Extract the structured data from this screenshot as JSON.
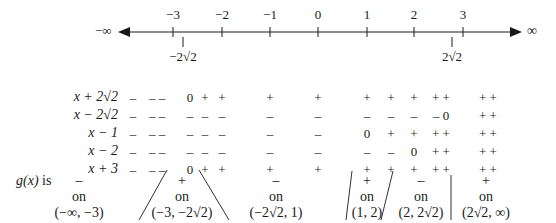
{
  "number_line": {
    "left_label": "−∞",
    "right_label": "∞",
    "ticks": [
      {
        "label": "−3",
        "x": 173
      },
      {
        "label": "−2",
        "x": 222
      },
      {
        "label": "−1",
        "x": 270
      },
      {
        "label": "0",
        "x": 318
      },
      {
        "label": "1",
        "x": 367
      },
      {
        "label": "2",
        "x": 414
      },
      {
        "label": "3",
        "x": 463
      }
    ],
    "sub_ticks": [
      {
        "label": "−2√2",
        "x": 183
      },
      {
        "label": "2√2",
        "x": 452
      }
    ]
  },
  "sign_chart": {
    "rows": [
      {
        "label": "x + 2√2",
        "signs": [
          "–",
          "– –",
          "0",
          "+",
          "+",
          "+",
          "+",
          "+",
          "+",
          "+",
          "+ +",
          "+ +"
        ]
      },
      {
        "label": "x − 2√2",
        "signs": [
          "–",
          "– –",
          "–",
          "–",
          "–",
          "–",
          "–",
          "–",
          "–",
          "–",
          "– 0",
          "+ +"
        ]
      },
      {
        "label": "x − 1",
        "signs": [
          "–",
          "– –",
          "–",
          "–",
          "–",
          "–",
          "–",
          "0",
          "+",
          "+",
          "+ +",
          "+ +"
        ]
      },
      {
        "label": "x − 2",
        "signs": [
          "–",
          "– –",
          "–",
          "–",
          "–",
          "–",
          "–",
          "–",
          "–",
          "0",
          "+ +",
          "+ +"
        ]
      },
      {
        "label": "x + 3",
        "signs": [
          "–",
          "– –",
          "0",
          "+",
          "+",
          "+",
          "+",
          "+",
          "+",
          "+",
          "+ +",
          "+ +"
        ]
      }
    ],
    "columns_x": [
      133,
      157,
      190,
      205,
      222,
      270,
      318,
      367,
      391,
      414,
      441,
      488
    ]
  },
  "g_row": {
    "label_prefix": "g(x)",
    "label_suffix": "is",
    "intervals": [
      {
        "sign": "–",
        "on": "on",
        "interval": "(−∞, −3)",
        "x": 133
      },
      {
        "sign": "+",
        "on": "on",
        "interval": "(−3, −2√2)",
        "x": 182
      },
      {
        "sign": "–",
        "on": "on",
        "interval": "(−2√2, 1)",
        "x": 276
      },
      {
        "sign": "+",
        "on": "on",
        "interval": "(1, 2)",
        "x": 367
      },
      {
        "sign": "–",
        "on": "on",
        "interval": "(2, 2√2)",
        "x": 421
      },
      {
        "sign": "+",
        "on": "on",
        "interval": "(2√2, ∞)",
        "x": 486
      }
    ]
  }
}
